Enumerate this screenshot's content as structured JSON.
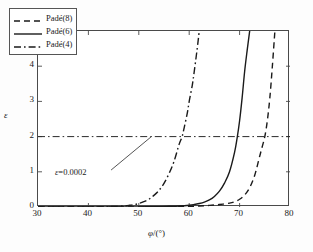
{
  "chart_data": {
    "type": "line",
    "title": "",
    "xlabel": "φ/(°)",
    "ylabel": "ε",
    "y_multiplier": "×10⁻⁴",
    "xlim": [
      30,
      80
    ],
    "ylim": [
      0,
      5
    ],
    "xticks": [
      30,
      40,
      50,
      60,
      70,
      80
    ],
    "yticks": [
      0,
      1,
      2,
      3,
      4,
      5
    ],
    "xtick_labels": [
      "30",
      "40",
      "50",
      "60",
      "70",
      "80"
    ],
    "ytick_labels": [
      "0",
      "1",
      "2",
      "3",
      "4",
      "5"
    ],
    "grid": false,
    "legend_position": "upper left",
    "series": [
      {
        "name": "Padé(8)",
        "style": "dashed",
        "color": "#1a1a1a",
        "x": [
          30,
          40,
          46,
          50,
          54,
          58,
          60,
          62,
          64,
          66,
          68,
          69,
          70,
          71,
          72,
          73,
          74,
          74.5,
          75,
          75.5,
          76,
          76.5,
          77
        ],
        "y": [
          0.0,
          0.0,
          0.0,
          0.0,
          0.005,
          0.012,
          0.018,
          0.028,
          0.045,
          0.07,
          0.11,
          0.15,
          0.22,
          0.34,
          0.55,
          0.9,
          1.45,
          1.72,
          2.0,
          2.45,
          3.1,
          4.0,
          5.0
        ]
      },
      {
        "name": "Padé(6)",
        "style": "solid",
        "color": "#1a1a1a",
        "x": [
          30,
          40,
          46,
          50,
          54,
          56,
          58,
          60,
          61,
          62,
          63,
          64,
          65,
          66,
          67,
          68,
          69,
          69.5,
          70,
          70.5,
          71,
          71.5,
          72
        ],
        "y": [
          0.0,
          0.0,
          0.0,
          0.004,
          0.012,
          0.02,
          0.03,
          0.05,
          0.07,
          0.1,
          0.14,
          0.2,
          0.3,
          0.45,
          0.68,
          1.0,
          1.55,
          1.95,
          2.45,
          3.1,
          3.85,
          4.45,
          5.0
        ]
      },
      {
        "name": "Padé(4)",
        "style": "dashdot",
        "color": "#1a1a1a",
        "x": [
          30,
          38,
          42,
          45,
          46,
          47,
          48,
          49,
          50,
          51,
          52,
          53,
          54,
          55,
          56,
          57,
          58,
          58.6,
          59,
          59.6,
          60,
          60.6,
          61,
          61.5,
          62
        ],
        "y": [
          0.0,
          0.0,
          0.005,
          0.015,
          0.02,
          0.03,
          0.045,
          0.065,
          0.1,
          0.15,
          0.22,
          0.33,
          0.47,
          0.67,
          0.95,
          1.3,
          1.78,
          2.0,
          2.25,
          2.65,
          3.0,
          3.45,
          3.85,
          4.4,
          5.0
        ]
      }
    ],
    "reference_lines": [
      {
        "name": "threshold",
        "orientation": "horizontal",
        "value": 2,
        "style": "dashdot",
        "color": "#2a2a2a",
        "label": "ε=0.0002"
      }
    ],
    "annotations": [
      {
        "name": "threshold-annotation",
        "text_italic": "ε",
        "text_rest": "=0.0002",
        "leader_line": {
          "x1": 44.5,
          "y1": 1.05,
          "x2": 52.5,
          "y2": 2.0
        }
      }
    ]
  },
  "legend": {
    "items": [
      {
        "label": "Padé(8)",
        "style": "dashed"
      },
      {
        "label": "Padé(6)",
        "style": "solid"
      },
      {
        "label": "Padé(4)",
        "style": "dashdot"
      }
    ]
  }
}
